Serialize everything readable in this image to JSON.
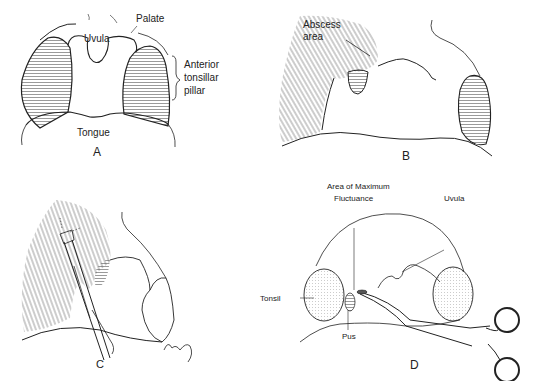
{
  "figure": {
    "panels": [
      {
        "id": "A",
        "letter": "A",
        "labels": {
          "palate": "Palate",
          "uvula": "Uvula",
          "anterior_pillar_1": "Anterior",
          "anterior_pillar_2": "tonsillar",
          "anterior_pillar_3": "pillar",
          "tongue": "Tongue"
        }
      },
      {
        "id": "B",
        "letter": "B",
        "labels": {
          "abscess_1": "Abscess",
          "abscess_2": "area"
        }
      },
      {
        "id": "C",
        "letter": "C",
        "labels": {
          "signature": "K. Tang"
        }
      },
      {
        "id": "D",
        "letter": "D",
        "labels": {
          "max_fluct_1": "Area of Maximum",
          "max_fluct_2": "Fluctuance",
          "uvula": "Uvula",
          "tonsil": "Tonsil",
          "pus": "Pus"
        }
      }
    ],
    "colors": {
      "line": "#1a1a1a",
      "hatch": "#555555",
      "background": "#ffffff"
    }
  }
}
